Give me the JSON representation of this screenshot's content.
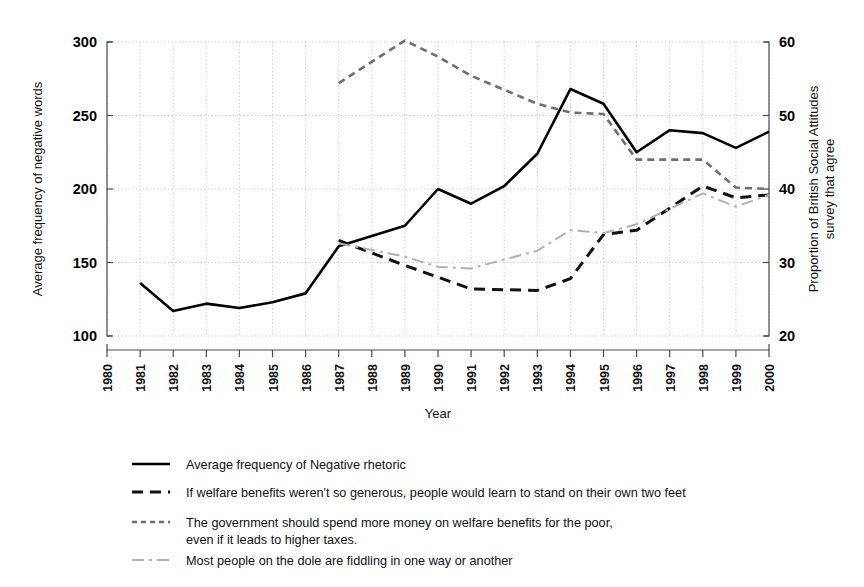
{
  "chart_data": {
    "type": "line",
    "title": "",
    "xlabel": "Year",
    "ylabel": "Average frequency of negative words",
    "ylabel_right": "Proportion of British Social Attitudes survey that agree",
    "x": [
      1980,
      1981,
      1982,
      1983,
      1984,
      1985,
      1986,
      1987,
      1988,
      1989,
      1990,
      1991,
      1992,
      1993,
      1994,
      1995,
      1996,
      1997,
      1998,
      1999,
      2000
    ],
    "xticklabels": [
      "1980",
      "1981",
      "1982",
      "1983",
      "1984",
      "1985",
      "1986",
      "1987",
      "1988",
      "1989",
      "1990",
      "1991",
      "1992",
      "1993",
      "1994",
      "1995",
      "1996",
      "1997",
      "1998",
      "1999",
      "2000"
    ],
    "xlim": [
      1980,
      2000
    ],
    "ylim": [
      100,
      300
    ],
    "yticks": [
      100,
      150,
      200,
      250,
      300
    ],
    "yticklabels": [
      "100",
      "150",
      "200",
      "250",
      "300"
    ],
    "ylim_right": [
      20,
      60
    ],
    "yticks_right": [
      20,
      30,
      40,
      50,
      60
    ],
    "yticklabels_right": [
      "20",
      "30",
      "40",
      "50",
      "60"
    ],
    "grid": true,
    "legend_position": "below",
    "series": [
      {
        "name": "Average frequency of Negative rhetoric",
        "axis": "left",
        "style": "solid",
        "color": "#000000",
        "x": [
          1981,
          1982,
          1983,
          1984,
          1985,
          1986,
          1987,
          1988,
          1989,
          1990,
          1991,
          1992,
          1993,
          1994,
          1995,
          1996,
          1997,
          1998,
          1999,
          2000
        ],
        "values": [
          136,
          117,
          122,
          119,
          123,
          129,
          161,
          168,
          175,
          200,
          190,
          202,
          224,
          268,
          258,
          225,
          240,
          238,
          228,
          239
        ]
      },
      {
        "name": "If welfare benefits weren't so generous, people would learn to stand on their own two feet",
        "axis": "right",
        "style": "dashed",
        "color": "#111111",
        "x": [
          1987,
          1989,
          1990,
          1991,
          1993,
          1994,
          1995,
          1996,
          1998,
          1999,
          2000
        ],
        "values_left": [
          165,
          148,
          140,
          132,
          131,
          139,
          169,
          172,
          202,
          194,
          196
        ],
        "values": [
          33.0,
          29.6,
          28.0,
          26.4,
          26.2,
          27.8,
          33.8,
          34.4,
          40.4,
          38.8,
          39.2
        ]
      },
      {
        "name": "The government should spend more money on welfare benefits for the poor, even if it leads to higher taxes.",
        "axis": "right",
        "style": "dotted",
        "color": "#6e6e6e",
        "x": [
          1987,
          1989,
          1990,
          1991,
          1993,
          1994,
          1995,
          1996,
          1998,
          1999,
          2000
        ],
        "values_left": [
          272,
          301,
          290,
          277,
          258,
          252,
          251,
          220,
          220,
          201,
          200
        ],
        "values": [
          54.4,
          60.2,
          58.0,
          55.4,
          51.6,
          50.4,
          50.2,
          44.0,
          44.0,
          40.2,
          40.0
        ]
      },
      {
        "name": "Most people on the dole are fiddling in one way or another",
        "axis": "right",
        "style": "dashdot",
        "color": "#b0b0b0",
        "x": [
          1987,
          1989,
          1990,
          1991,
          1993,
          1994,
          1995,
          1996,
          1998,
          1999,
          2000
        ],
        "values_left": [
          163,
          154,
          147,
          146,
          158,
          172,
          170,
          176,
          197,
          188,
          196
        ],
        "values": [
          32.6,
          30.8,
          29.4,
          29.2,
          31.6,
          34.4,
          34.0,
          35.2,
          39.4,
          37.6,
          39.2
        ]
      }
    ]
  },
  "legend": {
    "items": [
      {
        "label": "Average frequency of Negative rhetoric",
        "style": "solid"
      },
      {
        "label": "If welfare benefits weren't so generous, people would learn to stand on their own two feet",
        "style": "dashed"
      },
      {
        "label": "The government should spend more money on welfare benefits for the poor,",
        "label2": "even if it leads to higher taxes.",
        "style": "dotted"
      },
      {
        "label": "Most people on the dole are fiddling in one way or another",
        "style": "dashdot"
      }
    ]
  }
}
